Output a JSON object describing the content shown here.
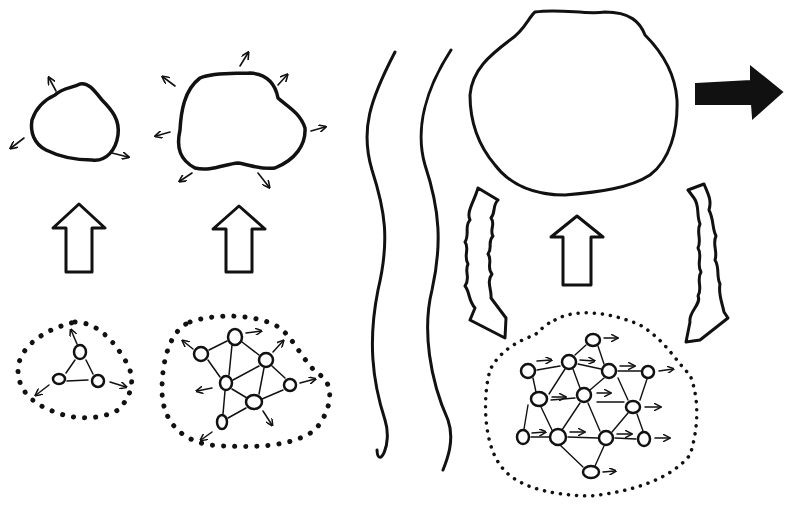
{
  "diagram": {
    "colors": {
      "ink": "#111111",
      "background": "#ffffff"
    },
    "stages": [
      {
        "id": "stage-1",
        "micro_nodes": 3,
        "macro_arrows_outward": 3
      },
      {
        "id": "stage-2",
        "micro_nodes": 7,
        "macro_arrows_outward": 6
      },
      {
        "id": "stage-3",
        "micro_nodes": 15,
        "feedback_arrows": 2,
        "motion_arrow": "right"
      }
    ],
    "icons": [
      "upward-hollow-arrow",
      "wavy-separator",
      "squiggly-feedback-arrow",
      "solid-right-arrow",
      "dotted-boundary",
      "node-circle"
    ]
  }
}
